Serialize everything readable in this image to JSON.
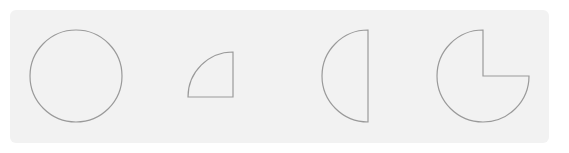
{
  "diagram": {
    "title": "",
    "background_color": "#f2f2f2",
    "stroke_color": "#9a9a9a",
    "shapes": [
      {
        "name": "full-circle",
        "fraction": "1",
        "cx": 76,
        "cy": 76,
        "r": 46
      },
      {
        "name": "quarter-circle",
        "fraction": "1/4",
        "corner_x": 233,
        "corner_y": 97,
        "r": 45
      },
      {
        "name": "half-circle",
        "fraction": "1/2",
        "cx": 368,
        "cy": 76,
        "r": 46
      },
      {
        "name": "three-quarter-circle",
        "fraction": "3/4",
        "cx": 483,
        "cy": 76,
        "r": 46
      }
    ]
  }
}
